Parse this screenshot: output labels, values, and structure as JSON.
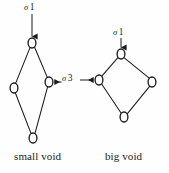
{
  "figure": {
    "title": "",
    "background_color": "#fefefe",
    "stroke_color": "#1b1b1b",
    "node_fill_color": "#ffffff"
  },
  "captions": {
    "small_void": "small void",
    "big_void": "big void"
  },
  "labels": {
    "sigma1_small": {
      "glyph": "σ",
      "index": "1",
      "text": "σ 1"
    },
    "sigma1_big": {
      "glyph": "σ",
      "index": "1",
      "text": "σ 1"
    },
    "sigma3": {
      "glyph": "σ",
      "index": "3",
      "text": "σ 3"
    }
  },
  "diagram_data": {
    "type": "diagram",
    "description": "Two vacancy/void cluster diagrams: a narrow tall rhombus labelled 'small void' and a wider diamond labelled 'big void', each built from four ring nodes joined by bonds. Arrows mark sigma-1 and sigma-3 sites.",
    "graphs": [
      {
        "name": "small void",
        "shape": "narrow rhombus",
        "nodes": [
          {
            "id": "s-top",
            "cx": 32,
            "cy": 43,
            "rx": 4.0,
            "ry": 5.0
          },
          {
            "id": "s-left",
            "cx": 14,
            "cy": 88,
            "rx": 4.0,
            "ry": 5.0
          },
          {
            "id": "s-right",
            "cx": 49,
            "cy": 82,
            "rx": 4.0,
            "ry": 5.0
          },
          {
            "id": "s-bottom",
            "cx": 33,
            "cy": 138,
            "rx": 4.0,
            "ry": 5.0
          }
        ],
        "edges": [
          [
            "s-top",
            "s-left"
          ],
          [
            "s-top",
            "s-right"
          ],
          [
            "s-left",
            "s-bottom"
          ],
          [
            "s-right",
            "s-bottom"
          ]
        ]
      },
      {
        "name": "big void",
        "shape": "wide diamond",
        "nodes": [
          {
            "id": "b-top",
            "cx": 121,
            "cy": 54,
            "rx": 4.0,
            "ry": 5.0
          },
          {
            "id": "b-left",
            "cx": 99,
            "cy": 80,
            "rx": 4.0,
            "ry": 5.0
          },
          {
            "id": "b-right",
            "cx": 152,
            "cy": 82,
            "rx": 4.0,
            "ry": 5.0
          },
          {
            "id": "b-bottom",
            "cx": 124,
            "cy": 117,
            "rx": 4.0,
            "ry": 5.0
          }
        ],
        "edges": [
          [
            "b-top",
            "b-left"
          ],
          [
            "b-top",
            "b-right"
          ],
          [
            "b-left",
            "b-bottom"
          ],
          [
            "b-right",
            "b-bottom"
          ]
        ]
      }
    ],
    "annotations": [
      {
        "id": "arrow-sigma1-small",
        "label": "σ 1",
        "direction": "down",
        "from": {
          "x": 32,
          "y": 14
        },
        "to": {
          "x": 32,
          "y": 37
        },
        "target_node": "s-top"
      },
      {
        "id": "arrow-sigma1-big",
        "label": "σ 1",
        "direction": "down",
        "from": {
          "x": 121,
          "y": 37
        },
        "to": {
          "x": 121,
          "y": 48
        },
        "target_node": "b-top"
      },
      {
        "id": "arrow-sigma3-left",
        "label": "σ 3",
        "direction": "left",
        "from": {
          "x": 61,
          "y": 82
        },
        "to": {
          "x": 54,
          "y": 82
        },
        "target_node": "s-right"
      },
      {
        "id": "arrow-sigma3-right",
        "label": "σ 3",
        "direction": "right",
        "from": {
          "x": 80,
          "y": 80
        },
        "to": {
          "x": 94,
          "y": 80
        },
        "target_node": "b-left"
      }
    ]
  }
}
